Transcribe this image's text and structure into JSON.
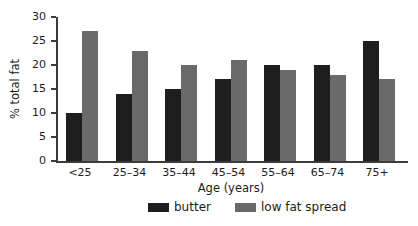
{
  "chart_data": {
    "type": "bar",
    "title": "",
    "categories": [
      "<25",
      "25–34",
      "35–44",
      "45–54",
      "55–64",
      "65–74",
      "75+"
    ],
    "series": [
      {
        "name": "butter",
        "color": "#1e1e1e",
        "values": [
          10,
          14,
          15,
          17,
          20,
          20,
          25
        ]
      },
      {
        "name": "low fat spread",
        "color": "#6a6a6a",
        "values": [
          27,
          23,
          20,
          21,
          19,
          18,
          17
        ]
      }
    ],
    "xlabel": "Age (years)",
    "ylabel": "% total fat",
    "ylim": [
      0,
      30
    ],
    "yticks": [
      0,
      5,
      10,
      15,
      20,
      25,
      30
    ],
    "grid": false,
    "legend_position": "bottom",
    "axis_color": "#3c3c3c",
    "background_color": "#ffffff"
  }
}
